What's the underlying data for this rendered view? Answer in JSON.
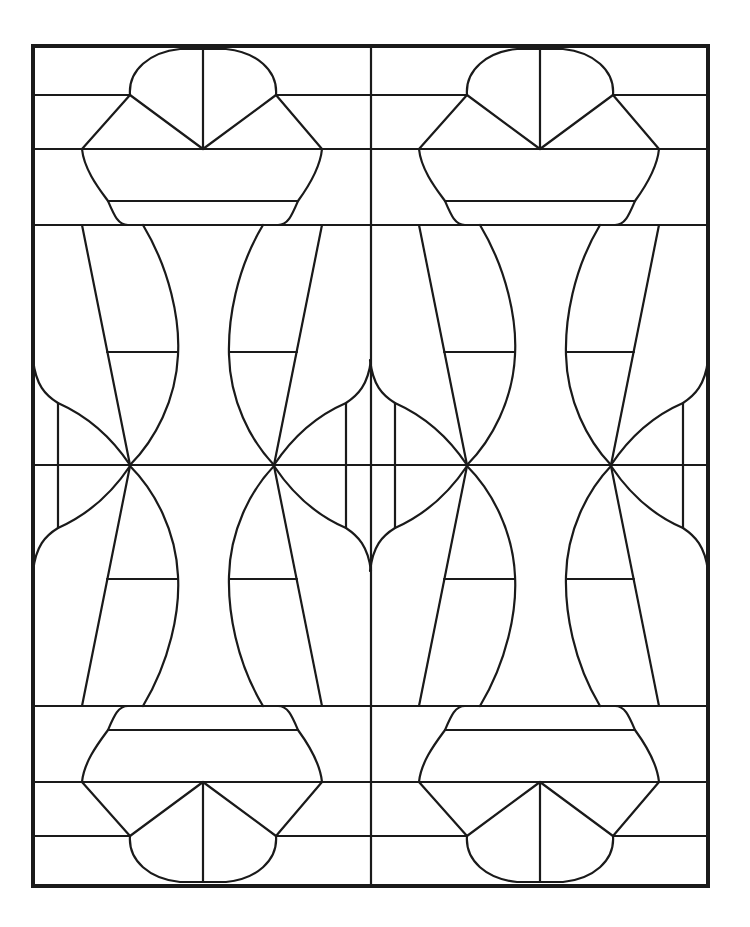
{
  "colors": {
    "line": "#1a1a1a",
    "background": "#ffffff"
  },
  "pattern": {
    "columns": 2,
    "motif": "capital-dome-vase-hourglass",
    "symmetry": "mirrored top/bottom and left/right within each tile"
  }
}
